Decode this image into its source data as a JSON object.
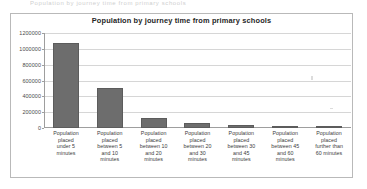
{
  "scan_artifact_text": "Population by journey time from primary schools",
  "chart_data": {
    "type": "bar",
    "title": "Population by journey time from primary schools",
    "xlabel": "",
    "ylabel": "",
    "ylim": [
      0,
      1200000
    ],
    "grid": true,
    "legend": false,
    "categories": [
      "Population placed under 5 minutes",
      "Population placed between 5 and 10 minutes",
      "Population placed between 10 and 20 minutes",
      "Population placed between 20 and 30 minutes",
      "Population placed between 30 and 45 minutes",
      "Population placed between 45 and 60 minutes",
      "Population placed further than 60 minutes"
    ],
    "category_lines": [
      [
        "Population",
        "placed",
        "under 5",
        "minutes"
      ],
      [
        "Population",
        "placed",
        "between 5",
        "and 10",
        "minutes"
      ],
      [
        "Population",
        "placed",
        "between 10",
        "and 20",
        "minutes"
      ],
      [
        "Population",
        "placed",
        "between 20",
        "and 30",
        "minutes"
      ],
      [
        "Population",
        "placed",
        "between 30",
        "and 45",
        "minutes"
      ],
      [
        "Population",
        "placed",
        "between 45",
        "and 60",
        "minutes"
      ],
      [
        "Population",
        "placed",
        "further than",
        "60 minutes"
      ]
    ],
    "values": [
      1074000,
      505000,
      128000,
      62000,
      36000,
      18000,
      10000
    ],
    "ytick_values": [
      1200000,
      1000000,
      800000,
      600000,
      400000,
      200000,
      0
    ],
    "ytick_labels": [
      "1200000",
      "1000000",
      "800000",
      "600000",
      "400000",
      "200000",
      "0"
    ],
    "series_color": "#6d6d6d",
    "grid_color": "#d6d6d6",
    "axis_color": "#9e9e9e",
    "border_color": "#b9b9b9",
    "background_color": "#ffffff"
  }
}
